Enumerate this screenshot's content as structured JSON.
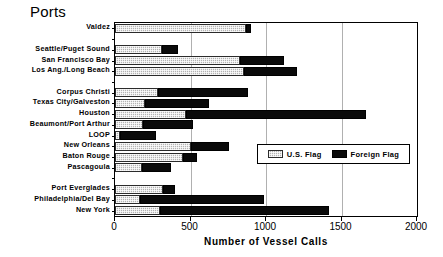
{
  "chart_data": {
    "type": "bar",
    "orientation": "horizontal",
    "stacked": true,
    "title": "Ports",
    "xlabel": "Number of Vessel Calls",
    "ylabel": "",
    "xlim": [
      0,
      2000
    ],
    "xticks": [
      0,
      500,
      1000,
      1500,
      2000
    ],
    "xtick_labels": [
      "0",
      "500",
      "1000",
      "1500",
      "2000"
    ],
    "grid": true,
    "legend_position": "center-right-inside",
    "categories": [
      "Valdez",
      "",
      "Seattle/Puget Sound",
      "San Francisco Bay",
      "Los Ang./Long Beach",
      "",
      "Corpus Christi",
      "Texas City/Galveston",
      "Houston",
      "Beaumont/Port Arthur",
      "LOOP",
      "New Orleans",
      "Baton Rouge",
      "Pascagoula",
      "",
      "Port Everglades",
      "Philadelphia/Del Bay",
      "New York"
    ],
    "series": [
      {
        "name": "U.S. Flag",
        "color": "#b3b3b3",
        "pattern": "dotted-gray",
        "values": [
          870,
          null,
          310,
          830,
          855,
          null,
          285,
          200,
          470,
          185,
          35,
          505,
          450,
          180,
          null,
          315,
          165,
          300
        ]
      },
      {
        "name": "Foreign Flag",
        "color": "#0a0a0a",
        "pattern": "solid-black",
        "values": [
          30,
          null,
          110,
          290,
          350,
          null,
          595,
          425,
          1195,
          330,
          235,
          250,
          95,
          190,
          null,
          85,
          820,
          1115
        ]
      }
    ],
    "totals": [
      900,
      null,
      420,
      1120,
      1205,
      null,
      880,
      625,
      1665,
      515,
      270,
      755,
      545,
      370,
      null,
      400,
      985,
      1415
    ]
  },
  "legend": {
    "entries": [
      {
        "label": "U.S. Flag",
        "swatch": "us-flag-swatch"
      },
      {
        "label": "Foreign Flag",
        "swatch": "foreign-flag-swatch"
      }
    ]
  }
}
